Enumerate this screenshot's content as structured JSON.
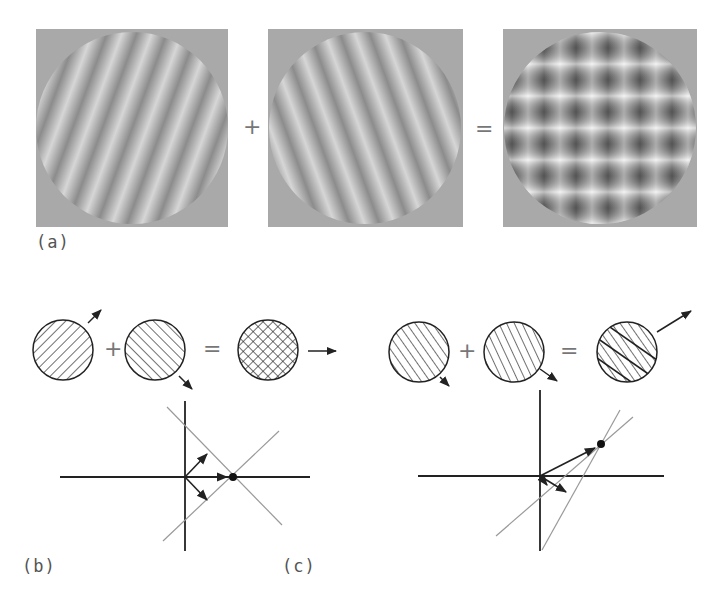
{
  "figure": {
    "panel_a": {
      "label": "(a)",
      "plus": "+",
      "equals": "=",
      "images": [
        {
          "name": "grating-1",
          "description": "circular sinusoidal grating, stripes tilted right"
        },
        {
          "name": "grating-2",
          "description": "circular sinusoidal grating, stripes tilted left"
        },
        {
          "name": "plaid",
          "description": "sum of two gratings forming a checkered plaid"
        }
      ],
      "colors": {
        "background": "#aaaaaa",
        "stripe_light": "#d8d8d8",
        "stripe_dark": "#8a8a8a"
      }
    },
    "panel_b": {
      "label": "(b)",
      "plus": "+",
      "equals": "=",
      "description": "symmetric gratings; plaid moves horizontally right; velocity-space constraint lines intersect on horizontal axis"
    },
    "panel_c": {
      "label": "(c)",
      "plus": "+",
      "equals": "=",
      "description": "asymmetric gratings; plaid moves up-right; intersection of constraints lies above horizontal axis"
    },
    "caption": {
      "text": "(truncated caption — only top of glyphs visible)"
    }
  }
}
